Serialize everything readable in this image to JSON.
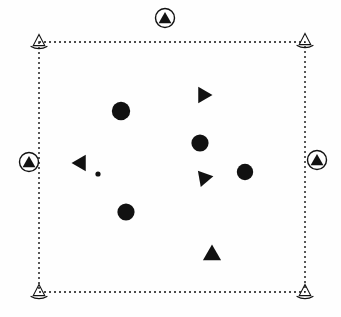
{
  "figure": {
    "title": "Marker Layout Diagram",
    "width": 341,
    "height": 317,
    "background_color": "#fefefe",
    "ink_color": "#111111"
  },
  "boundary": {
    "label": "dashed-boundary-rectangle",
    "x": 39,
    "y": 42,
    "width": 266,
    "height": 250,
    "stroke_color": "#111111",
    "stroke_width": 1.4,
    "dash_pattern": "2,3",
    "fill": "none"
  },
  "chart_data": {
    "type": "scatter",
    "title": "Marker Layout Diagram",
    "xlabel": "",
    "ylabel": "",
    "xlim": [
      0,
      341
    ],
    "ylim": [
      0,
      317
    ],
    "grid": false,
    "legend": "none",
    "boundary_box": {
      "x": 39,
      "y": 42,
      "width": 266,
      "height": 250
    },
    "series": [
      {
        "name": "filled-circles",
        "marker": "circle-filled",
        "color": "#111111",
        "points": [
          {
            "id": "circle-1",
            "x": 121,
            "y": 111,
            "size": 9.2
          },
          {
            "id": "circle-2",
            "x": 200,
            "y": 143,
            "size": 8.6
          },
          {
            "id": "circle-3",
            "x": 245,
            "y": 172,
            "size": 8.2
          },
          {
            "id": "circle-4",
            "x": 126,
            "y": 212,
            "size": 8.6
          },
          {
            "id": "circle-5-small",
            "x": 98,
            "y": 174,
            "size": 2.6
          }
        ]
      },
      {
        "name": "filled-triangles",
        "marker": "triangle-filled",
        "color": "#111111",
        "points": [
          {
            "id": "triangle-right-1",
            "x": 203,
            "y": 95,
            "size": 9.5,
            "rotation": 90
          },
          {
            "id": "triangle-left-1",
            "x": 81,
            "y": 163,
            "size": 9.5,
            "rotation": -90
          },
          {
            "id": "triangle-downleft-1",
            "x": 204,
            "y": 178,
            "size": 9.5,
            "rotation": 200
          },
          {
            "id": "triangle-up-1",
            "x": 212,
            "y": 255,
            "size": 10.5,
            "rotation": 0
          }
        ]
      },
      {
        "name": "corner-anchors",
        "marker": "triangle-outline",
        "color": "#111111",
        "points": [
          {
            "id": "corner-top-left",
            "x": 39,
            "y": 42,
            "size": 8
          },
          {
            "id": "corner-top-right",
            "x": 305,
            "y": 41,
            "size": 8
          },
          {
            "id": "corner-bottom-left",
            "x": 39,
            "y": 292,
            "size": 8
          },
          {
            "id": "corner-bottom-right",
            "x": 305,
            "y": 292,
            "size": 8
          }
        ]
      },
      {
        "name": "edge-badges",
        "marker": "circled-triangle",
        "color": "#111111",
        "points": [
          {
            "id": "badge-top",
            "x": 165,
            "y": 18,
            "size": 9.5
          },
          {
            "id": "badge-left",
            "x": 29,
            "y": 162,
            "size": 9.5
          },
          {
            "id": "badge-right",
            "x": 317,
            "y": 160,
            "size": 9.5
          }
        ]
      }
    ]
  }
}
